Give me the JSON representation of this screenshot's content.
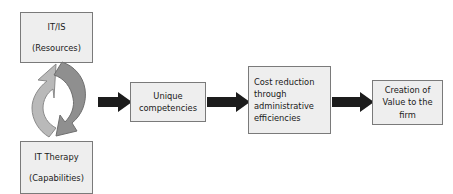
{
  "diagram": {
    "background_color": "#ffffff",
    "box_fill": "#eeeeee",
    "box_border": "#7a7a7a",
    "arrow_color": "#1c1c1c",
    "cycle_arrow_light": "#b9b9b9",
    "cycle_arrow_dark": "#8f8f8f",
    "nodes": {
      "resources": {
        "line1": "IT/IS",
        "line2": "(Resources)"
      },
      "capabilities": {
        "line1": "IT Therapy",
        "line2": "(Capabilities)"
      },
      "competencies": {
        "line1": "Unique",
        "line2": "competencies"
      },
      "cost_reduction": {
        "line1": "Cost reduction",
        "line2": "through",
        "line3": "administrative",
        "line4": "efficiencies"
      },
      "value": {
        "line1": "Creation of",
        "line2": "Value to the",
        "line3": "firm"
      }
    },
    "connectors": {
      "cycle_label": "circular-cycle-arrows",
      "arrow1_label": "arrow-to-competencies",
      "arrow2_label": "arrow-to-cost-reduction",
      "arrow3_label": "arrow-to-value"
    }
  }
}
